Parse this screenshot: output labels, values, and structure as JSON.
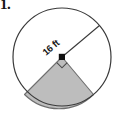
{
  "figure": {
    "problem_number": "1.",
    "type": "circle-with-shaded-sector",
    "radius_label": "16 ft",
    "center_dot": "center-point",
    "right_angle_mark": "90-degree-angle-marker",
    "colors": {
      "stroke": "#3a3a3a",
      "sector_fill": "#bdbdbd",
      "sector_stroke": "#6e6e6e",
      "center_dot": "#111111",
      "background": "#ffffff",
      "text": "#161616"
    },
    "geometry": {
      "center_x": 62,
      "center_y": 57,
      "radius": 49,
      "radius_line_angle_deg": -40,
      "sector_start_angle_deg": 50,
      "sector_end_angle_deg": 140,
      "sector_sweep_deg": 90
    }
  }
}
